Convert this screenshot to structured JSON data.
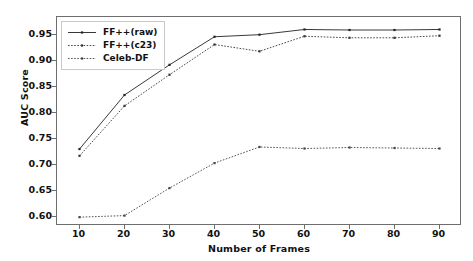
{
  "chart_data": {
    "type": "line",
    "title": "",
    "xlabel": "Number of Frames",
    "ylabel": "AUC Score",
    "x": [
      10,
      20,
      30,
      40,
      50,
      60,
      70,
      80,
      90
    ],
    "xticks": [
      "10",
      "20",
      "30",
      "40",
      "50",
      "60",
      "70",
      "80",
      "90"
    ],
    "yticks": [
      "0.60",
      "0.65",
      "0.70",
      "0.75",
      "0.80",
      "0.85",
      "0.90",
      "0.95"
    ],
    "ytickvalues": [
      0.6,
      0.65,
      0.7,
      0.75,
      0.8,
      0.85,
      0.9,
      0.95
    ],
    "xlim": [
      5,
      95
    ],
    "ylim": [
      0.583,
      0.985
    ],
    "grid": false,
    "legend_position": "upper left",
    "series": [
      {
        "name": "FF++(raw)",
        "style": "solid",
        "marker": "point",
        "color": "#222222",
        "values": [
          0.731,
          0.835,
          0.893,
          0.947,
          0.951,
          0.961,
          0.96,
          0.96,
          0.961
        ]
      },
      {
        "name": "FF++(c23)",
        "style": "dotted",
        "marker": "point",
        "color": "#333333",
        "values": [
          0.718,
          0.814,
          0.874,
          0.932,
          0.919,
          0.948,
          0.945,
          0.945,
          0.949
        ]
      },
      {
        "name": "Celeb-DF",
        "style": "dotted",
        "marker": "point",
        "color": "#444444",
        "values": [
          0.6,
          0.603,
          0.656,
          0.704,
          0.735,
          0.732,
          0.734,
          0.733,
          0.732
        ]
      }
    ]
  },
  "legend": {
    "items": [
      {
        "label": "FF++(raw)"
      },
      {
        "label": "FF++(c23)"
      },
      {
        "label": "Celeb-DF"
      }
    ]
  },
  "caption": {
    "text": ""
  }
}
